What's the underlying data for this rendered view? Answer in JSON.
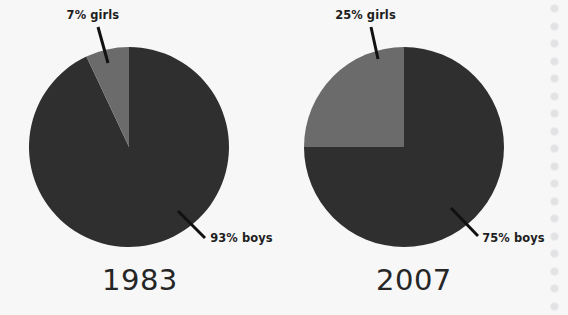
{
  "figure": {
    "background_color": "#f7f7f7",
    "width": 568,
    "height": 315
  },
  "chart_data": {
    "type": "pie",
    "title": "",
    "subtitle": "",
    "xlabel": "",
    "ylabel": "",
    "legend_position": "none",
    "grid": false,
    "panels": [
      {
        "name": "1983",
        "year_label": "1983",
        "center": [
          129,
          147
        ],
        "radius": 100,
        "start_angle_deg": 90,
        "direction": "counterclockwise",
        "slices": [
          {
            "label": "7% girls",
            "category": "girls",
            "value": 7,
            "unit": "%",
            "color": "#6b6b6b",
            "callout": "7% girls"
          },
          {
            "label": "93% boys",
            "category": "boys",
            "value": 93,
            "unit": "%",
            "color": "#2f2f2f",
            "callout": "93% boys"
          }
        ]
      },
      {
        "name": "2007",
        "year_label": "2007",
        "center": [
          404,
          147
        ],
        "radius": 100,
        "start_angle_deg": 90,
        "direction": "counterclockwise",
        "slices": [
          {
            "label": "25% girls",
            "category": "girls",
            "value": 25,
            "unit": "%",
            "color": "#6b6b6b",
            "callout": "25% girls"
          },
          {
            "label": "75% boys",
            "category": "boys",
            "value": 75,
            "unit": "%",
            "color": "#2f2f2f",
            "callout": "75% boys"
          }
        ]
      }
    ],
    "categories": [
      "girls",
      "boys"
    ],
    "series": [
      {
        "name": "1983",
        "values": [
          7,
          93
        ]
      },
      {
        "name": "2007",
        "values": [
          25,
          75
        ]
      }
    ],
    "colors": {
      "girls": "#6b6b6b",
      "boys": "#2f2f2f",
      "leader_line": "#111111",
      "text": "#1d1d1d",
      "background": "#f7f7f7",
      "binding_hole": "#e2e2e4"
    }
  },
  "labels": {
    "girls_1983": "7% girls",
    "boys_1983": "93% boys",
    "girls_2007": "25% girls",
    "boys_2007": "75% boys",
    "year_1983": "1983",
    "year_2007": "2007"
  },
  "page": {
    "binding_hole_count": 18
  }
}
